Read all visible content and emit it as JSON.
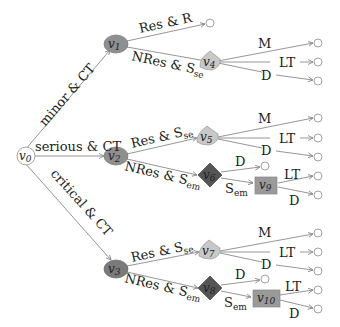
{
  "colors": {
    "edge": "#8a8a8a",
    "ellipse_node": "#8f8f8f",
    "ellipse_node_dark": "#7a7a7a",
    "triangle_node": "#c8c8c8",
    "diamond_node": "#555555",
    "square_node": "#9a9a9a",
    "root_node": "#ffffff"
  },
  "nodes": {
    "v0": {
      "name": "v",
      "sub": "0"
    },
    "v1": {
      "name": "v",
      "sub": "1"
    },
    "v2": {
      "name": "v",
      "sub": "2"
    },
    "v3": {
      "name": "v",
      "sub": "3"
    },
    "v4": {
      "name": "v",
      "sub": "4"
    },
    "v5": {
      "name": "v",
      "sub": "5"
    },
    "v6": {
      "name": "v",
      "sub": "6"
    },
    "v7": {
      "name": "v",
      "sub": "7"
    },
    "v8": {
      "name": "v",
      "sub": "8"
    },
    "v9": {
      "name": "v",
      "sub": "9"
    },
    "v10": {
      "name": "v",
      "sub": "10"
    }
  },
  "edges": {
    "v0_v1": "minor & CT",
    "v0_v2": "serious & CT",
    "v0_v3": "critical & CT",
    "v1_leaf": "Res & R",
    "v1_v4": {
      "main": "NRes & S",
      "sub": "se"
    },
    "v4_M": "M",
    "v4_LT": "LT",
    "v4_D": "D",
    "v2_v5": {
      "main": "Res & S",
      "sub": "se"
    },
    "v2_v6": {
      "main": "NRes & S",
      "sub": "em"
    },
    "v5_M": "M",
    "v5_LT": "LT",
    "v5_D": "D",
    "v6_D": "D",
    "v6_v9": {
      "main": "S",
      "sub": "em"
    },
    "v9_LT": "LT",
    "v9_D": "D",
    "v3_v7": {
      "main": "Res & S",
      "sub": "se"
    },
    "v3_v8": {
      "main": "NRes & S",
      "sub": "em"
    },
    "v7_M": "M",
    "v7_LT": "LT",
    "v7_D": "D",
    "v8_D": "D",
    "v8_v10": {
      "main": "S",
      "sub": "em"
    },
    "v10_LT": "LT",
    "v10_D": "D"
  }
}
